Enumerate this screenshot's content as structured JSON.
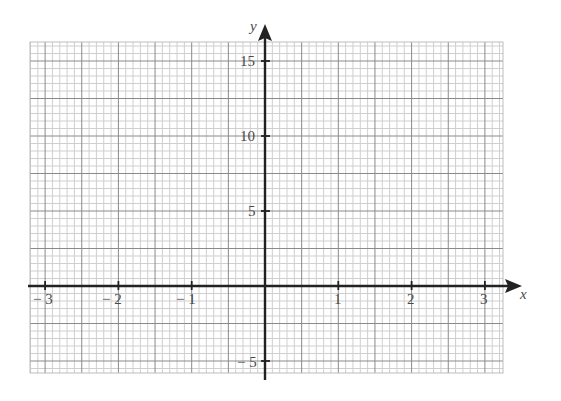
{
  "chart_data": {
    "type": "line",
    "title": "",
    "xlabel": "x",
    "ylabel": "y",
    "xlim": [
      -3.3,
      3.2
    ],
    "ylim": [
      -5.8,
      16.2
    ],
    "x_ticks": [
      -3,
      -2,
      -1,
      1,
      2,
      3
    ],
    "x_tick_labels": [
      "− 3",
      "− 2",
      "− 1",
      "1",
      "2",
      "3"
    ],
    "y_ticks": [
      15,
      10,
      5,
      -5
    ],
    "y_tick_labels": [
      "15",
      "10",
      "5",
      "− 5"
    ],
    "grid": true,
    "grid_minor_x_step": 0.1,
    "grid_major_x_step": 0.5,
    "grid_minor_y_step": 0.5,
    "grid_major_y_step": 2.5,
    "series": [],
    "legend": null
  },
  "colors": {
    "minor_grid": "#cfcfcf",
    "major_grid": "#8a8a8a",
    "axis": "#222222",
    "label": "#4a4a4a"
  }
}
